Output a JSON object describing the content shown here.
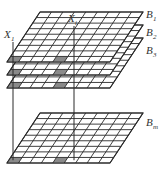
{
  "diagram": {
    "colors": {
      "line": "#2a2a2a",
      "fill": "#ffffff",
      "shade": "#8a8a8a",
      "text": "#333333"
    },
    "grid": {
      "cols": 9,
      "rows": 9
    },
    "layers": [
      {
        "id": "B1",
        "label": "B",
        "sub": "1",
        "back_y": 12,
        "front_y": 62,
        "visible_rows": 9,
        "label_x": 146,
        "label_y": 18
      },
      {
        "id": "B2",
        "label": "B",
        "sub": "2",
        "back_y": 25,
        "front_y": 75,
        "visible_rows": 9,
        "label_x": 146,
        "label_y": 36
      },
      {
        "id": "B3",
        "label": "B",
        "sub": "3",
        "back_y": 38,
        "front_y": 88,
        "visible_rows": 9,
        "label_x": 146,
        "label_y": 54
      },
      {
        "id": "Bm",
        "label": "B",
        "sub": "m",
        "back_y": 113,
        "front_y": 163,
        "visible_rows": 9,
        "label_x": 146,
        "label_y": 126
      }
    ],
    "geometry": {
      "back_left_x": 40,
      "back_right_x": 143,
      "front_left_x": 7,
      "front_right_x": 110
    },
    "highlight_cells": [
      {
        "name": "X1",
        "col": 0,
        "row": 8
      },
      {
        "name": "Xi",
        "col": 4,
        "row": 8
      }
    ],
    "pixel_labels": [
      {
        "label": "X",
        "sub": "1",
        "x": 4,
        "y": 38,
        "line_x": 13
      },
      {
        "label": "X",
        "sub": "i",
        "x": 68,
        "y": 22,
        "line_x": 74
      }
    ]
  }
}
